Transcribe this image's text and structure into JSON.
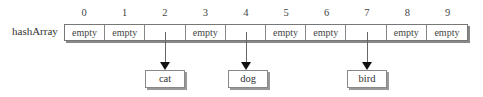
{
  "diagram": {
    "array_label": "hashArray",
    "indices": [
      "0",
      "1",
      "2",
      "3",
      "4",
      "5",
      "6",
      "7",
      "8",
      "9"
    ],
    "cells": [
      "empty",
      "empty",
      "",
      "empty",
      "",
      "empty",
      "empty",
      "",
      "empty",
      "empty"
    ],
    "entries": [
      {
        "index": 2,
        "value": "cat"
      },
      {
        "index": 4,
        "value": "dog"
      },
      {
        "index": 7,
        "value": "bird"
      }
    ]
  }
}
